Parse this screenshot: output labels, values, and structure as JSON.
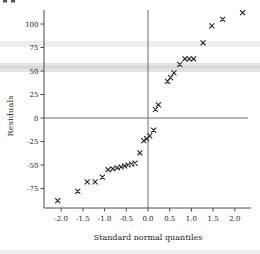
{
  "chart_data": {
    "type": "scatter",
    "xlabel": "Standard normal quantiles",
    "ylabel": "Residuals",
    "marker": "x",
    "marker_color": "#2f2f2f",
    "axis_color": "#4a4a4a",
    "zero_line_color": "#6e6e6e",
    "tick_label_color": "#222222",
    "xlim": [
      -2.4,
      2.37
    ],
    "ylim": [
      -96,
      117
    ],
    "grid": false,
    "zero_lines": true,
    "x_tick_values": [
      -2.0,
      -1.5,
      -1.0,
      -0.5,
      0.0,
      0.5,
      1.0,
      1.5,
      2.0
    ],
    "x_tick_labels": [
      "-2.0",
      "-1.5",
      "-1.0",
      "-0.5",
      "0.0",
      "0.5",
      "1.0",
      "1.5",
      "2.0"
    ],
    "y_tick_values": [
      100,
      75,
      50,
      25,
      0,
      -25,
      -50,
      -75
    ],
    "y_tick_labels": [
      "100",
      "75",
      "50",
      "25",
      "0",
      "-25",
      "-50",
      "-75"
    ],
    "points": [
      [
        -2.08,
        -88
      ],
      [
        -1.62,
        -78
      ],
      [
        -1.4,
        -68
      ],
      [
        -1.22,
        -68
      ],
      [
        -1.05,
        -63
      ],
      [
        -0.92,
        -55
      ],
      [
        -0.81,
        -54
      ],
      [
        -0.71,
        -53
      ],
      [
        -0.62,
        -52
      ],
      [
        -0.54,
        -51
      ],
      [
        -0.46,
        -50
      ],
      [
        -0.38,
        -49
      ],
      [
        -0.3,
        -48
      ],
      [
        -0.19,
        -37
      ],
      [
        -0.1,
        -24
      ],
      [
        -0.03,
        -22
      ],
      [
        0.04,
        -19
      ],
      [
        0.13,
        -13
      ],
      [
        0.17,
        9
      ],
      [
        0.24,
        14
      ],
      [
        0.45,
        39
      ],
      [
        0.52,
        43
      ],
      [
        0.6,
        48
      ],
      [
        0.73,
        57
      ],
      [
        0.85,
        63
      ],
      [
        0.95,
        63
      ],
      [
        1.05,
        63
      ],
      [
        1.27,
        80
      ],
      [
        1.47,
        98
      ],
      [
        1.72,
        105
      ],
      [
        2.18,
        112
      ]
    ]
  },
  "artifacts": {
    "scan_bands": [
      {
        "y": 41,
        "h": 6,
        "color": "#ededed"
      },
      {
        "y": 63,
        "h": 9,
        "color": "#e3e3e3"
      },
      {
        "y": 66,
        "h": 2.5,
        "color": "#d6d6d6"
      },
      {
        "y": 250,
        "h": 4,
        "color": "#efefef"
      }
    ],
    "top_left_marks": [
      {
        "x": 3,
        "w": 4,
        "color": "#555555"
      },
      {
        "x": 11,
        "w": 4,
        "color": "#555555"
      }
    ]
  }
}
